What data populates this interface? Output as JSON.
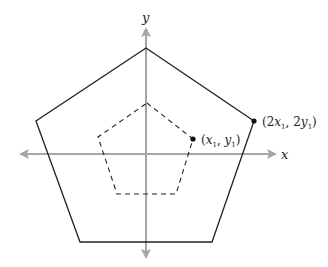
{
  "diagram": {
    "axes": {
      "x_label": "x",
      "y_label": "y",
      "color": "#a6a6a6"
    },
    "outer_pentagon": {
      "style": "solid",
      "color": "#222222",
      "vertices": [
        [
          146,
          48
        ],
        [
          254,
          121
        ],
        [
          212,
          242
        ],
        [
          80,
          242
        ],
        [
          36,
          121
        ]
      ]
    },
    "inner_pentagon": {
      "style": "dashed",
      "color": "#222222",
      "vertices": [
        [
          147,
          103
        ],
        [
          193,
          139
        ],
        [
          176,
          194
        ],
        [
          117,
          194
        ],
        [
          98,
          137
        ]
      ]
    },
    "points": [
      {
        "id": "inner-point",
        "x": 193,
        "y": 139,
        "label_open": "(",
        "var1": "x",
        "sub1": "1",
        "sep": ", ",
        "var2": "y",
        "sub2": "1",
        "label_close": ")"
      },
      {
        "id": "outer-point",
        "x": 254,
        "y": 121,
        "label_open": "(2",
        "var1": "x",
        "sub1": "1",
        "sep": ", 2",
        "var2": "y",
        "sub2": "1",
        "label_close": ")"
      }
    ]
  }
}
